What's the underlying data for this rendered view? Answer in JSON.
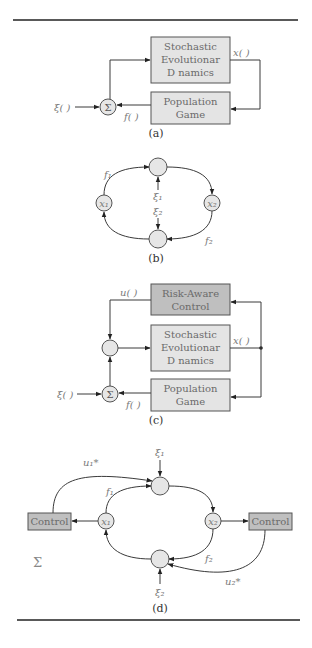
{
  "figure": {
    "panel_a": {
      "caption": "(a)",
      "box_dynamics": [
        "Stochastic",
        "Evolutionar",
        "D  namics"
      ],
      "box_game": [
        "Population",
        "Game"
      ],
      "sum_symbol": "Σ",
      "input_label": "ξ( )",
      "state_label": "x( )",
      "payoff_label": "f( )"
    },
    "panel_b": {
      "caption": "(b)",
      "node_x1": "x₁",
      "node_x2": "x₂",
      "flow_f1": "f₁",
      "flow_f2": "f₂",
      "noise_1": "ξ₁",
      "noise_2": "ξ₂"
    },
    "panel_c": {
      "caption": "(c)",
      "box_control": [
        "Risk-Aware",
        "Control"
      ],
      "box_dynamics": [
        "Stochastic",
        "Evolutionar",
        "D  namics"
      ],
      "box_game": [
        "Population",
        "Game"
      ],
      "sum_symbol": "Σ",
      "input_label": "ξ( )",
      "state_label": "x( )",
      "payoff_label": "f( )",
      "control_label": "u( )"
    },
    "panel_d": {
      "caption": "(d)",
      "control_left": "Control",
      "control_right": "Control",
      "node_x1": "x₁",
      "node_x2": "x₂",
      "flow_f1": "f₁",
      "flow_f2": "f₂",
      "noise_1": "ξ₁",
      "noise_2": "ξ₂",
      "control_u1": "u₁*",
      "control_u2": "u₂*",
      "sum_symbol": "Σ"
    }
  }
}
